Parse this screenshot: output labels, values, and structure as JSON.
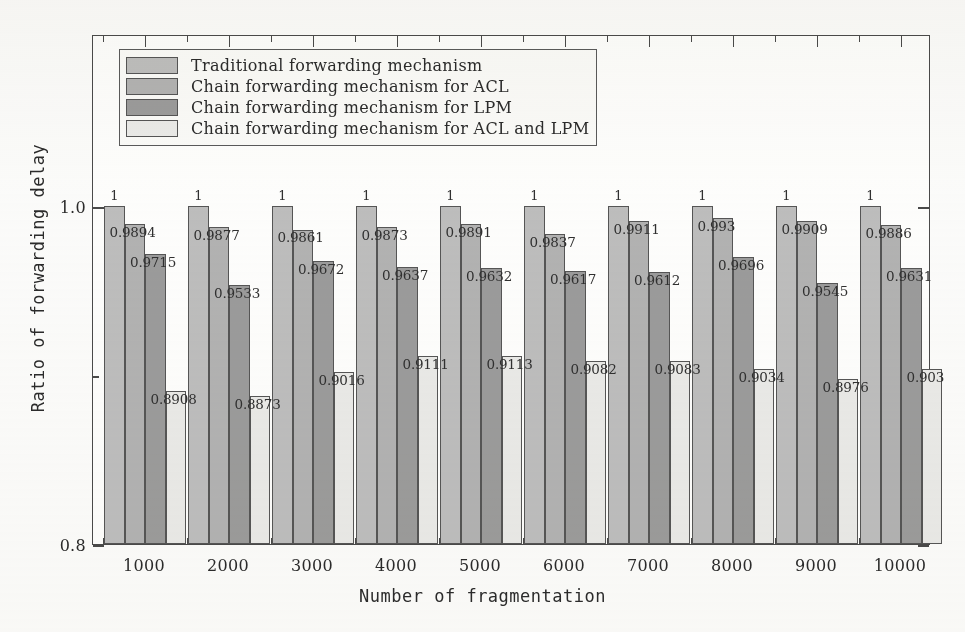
{
  "chart_data": {
    "type": "bar",
    "title": "",
    "xlabel": "Number of fragmentation",
    "ylabel": "Ratio of forwarding delay",
    "categories": [
      "1000",
      "2000",
      "3000",
      "4000",
      "5000",
      "6000",
      "7000",
      "8000",
      "9000",
      "10000"
    ],
    "ylim": [
      0.8,
      1.0
    ],
    "ytick_labels": [
      "1.0",
      "0.8"
    ],
    "ytick_values": [
      1.0,
      0.8
    ],
    "yminor_ticks": [
      0.9
    ],
    "grid": false,
    "legend_position": "upper-left-inside",
    "series": [
      {
        "name": "Traditional forwarding mechanism",
        "color": "#bdbdbd",
        "values": [
          1,
          1,
          1,
          1,
          1,
          1,
          1,
          1,
          1,
          1
        ],
        "labels": [
          "1",
          "1",
          "1",
          "1",
          "1",
          "1",
          "1",
          "1",
          "1",
          "1"
        ]
      },
      {
        "name": "Chain forwarding mechanism for ACL",
        "color": "#b2b2b2",
        "values": [
          0.9894,
          0.9877,
          0.9861,
          0.9873,
          0.9891,
          0.9837,
          0.9911,
          0.993,
          0.9909,
          0.9886
        ],
        "labels": [
          "0.9894",
          "0.9877",
          "0.9861",
          "0.9873",
          "0.9891",
          "0.9837",
          "0.9911",
          "0.993",
          "0.9909",
          "0.9886"
        ]
      },
      {
        "name": "Chain forwarding mechanism for LPM",
        "color": "#9b9b9b",
        "values": [
          0.9715,
          0.9533,
          0.9672,
          0.9637,
          0.9632,
          0.9617,
          0.9612,
          0.9696,
          0.9545,
          0.9631
        ],
        "labels": [
          "0.9715",
          "0.9533",
          "0.9672",
          "0.9637",
          "0.9632",
          "0.9617",
          "0.9612",
          "0.9696",
          "0.9545",
          "0.9631"
        ]
      },
      {
        "name": "Chain forwarding mechanism for ACL and LPM",
        "color": "#e9e9e7",
        "values": [
          0.8908,
          0.8873,
          0.9016,
          0.9111,
          0.9113,
          0.9082,
          0.9083,
          0.9034,
          0.8976,
          0.9036
        ],
        "labels": [
          "0.8908",
          "0.8873",
          "0.9016",
          "0.9111",
          "0.9113",
          "0.9082",
          "0.9083",
          "0.9034",
          "0.8976",
          "0.903"
        ]
      }
    ]
  },
  "legend": {
    "items": [
      {
        "label": "Traditional forwarding mechanism",
        "swatch": "s0"
      },
      {
        "label": "Chain forwarding mechanism for ACL",
        "swatch": "s1"
      },
      {
        "label": "Chain forwarding mechanism for LPM",
        "swatch": "s2"
      },
      {
        "label": "Chain forwarding mechanism for ACL and LPM",
        "swatch": "s3"
      }
    ]
  },
  "axes": {
    "x_title": "Number of fragmentation",
    "y_title": "Ratio of forwarding delay",
    "y_top_label": "1.0",
    "y_bottom_label": "0.8"
  }
}
